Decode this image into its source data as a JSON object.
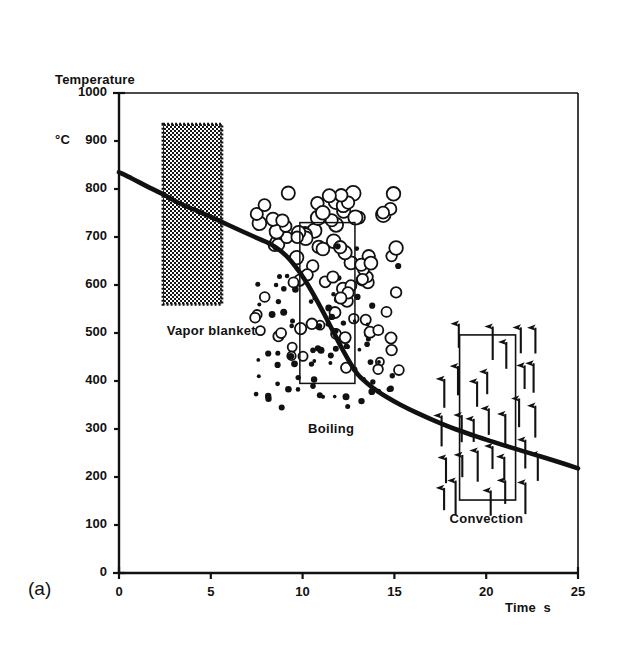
{
  "figure": {
    "panel_label": "(a)",
    "y_axis_title_line1": "Temperature",
    "y_axis_title_line2": "°C",
    "x_axis_title": "Time  s",
    "line_color": "#111111",
    "box_color": "#111111",
    "background": "#ffffff"
  },
  "regions": [
    {
      "name": "vapor-blanket",
      "label": "Vapor blanket",
      "x_start": 2.4,
      "x_end": 5.6,
      "y_start": 560,
      "y_end": 935,
      "fill": "dither-dark"
    },
    {
      "name": "boiling",
      "label": "Boiling",
      "x_start": 9.85,
      "x_end": 12.85,
      "y_start": 395,
      "y_end": 730,
      "fill": "bubbles"
    },
    {
      "name": "convection",
      "label": "Convection",
      "x_start": 18.55,
      "x_end": 21.6,
      "y_start": 152,
      "y_end": 496,
      "fill": "arrows"
    }
  ],
  "chart_data": {
    "type": "line",
    "title": "",
    "subtitle": "",
    "xlabel": "Time  s",
    "ylabel": "Temperature °C",
    "xlim": [
      0,
      25
    ],
    "ylim": [
      0,
      1000
    ],
    "xticks": [
      0,
      5,
      10,
      15,
      20,
      25
    ],
    "yticks": [
      0,
      100,
      200,
      300,
      400,
      500,
      600,
      700,
      800,
      900,
      1000
    ],
    "grid": false,
    "legend": null,
    "annotations": [
      {
        "text": "Vapor blanket",
        "x": 2.6,
        "y": 505
      },
      {
        "text": "Boiling",
        "x": 10.3,
        "y": 300
      },
      {
        "text": "Convection",
        "x": 18.0,
        "y": 112
      }
    ],
    "series": [
      {
        "name": "Cooling curve",
        "x": [
          0.0,
          0.7,
          1.5,
          2.4,
          3.2,
          4.1,
          5.0,
          5.9,
          6.7,
          7.4,
          8.0,
          8.6,
          9.1,
          9.6,
          10.1,
          10.6,
          11.1,
          11.6,
          12.1,
          12.6,
          13.0,
          13.5,
          14.0,
          14.6,
          15.3,
          16.2,
          17.2,
          18.3,
          19.5,
          20.8,
          22.0,
          23.2,
          24.2,
          25.0
        ],
        "y": [
          835,
          822,
          806,
          789,
          772,
          757,
          742,
          726,
          712,
          700,
          690,
          677,
          661,
          639,
          612,
          580,
          545,
          508,
          471,
          437,
          414,
          396,
          381,
          366,
          351,
          334,
          317,
          300,
          284,
          268,
          254,
          240,
          228,
          218
        ]
      }
    ]
  }
}
